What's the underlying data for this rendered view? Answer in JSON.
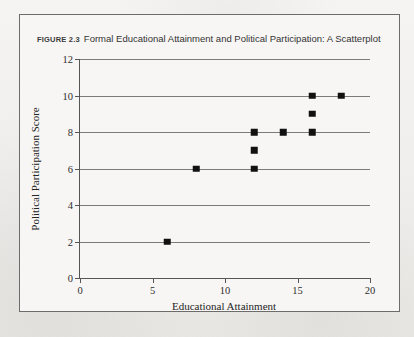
{
  "figure": {
    "label": "FIGURE 2.3",
    "caption": "Formal Educational Attainment and Political Participation: A Scatterplot"
  },
  "chart_data": {
    "type": "scatter",
    "title": "Formal Educational Attainment and Political Participation: A Scatterplot",
    "xlabel": "Educational Attainment",
    "ylabel": "Political Participation Score",
    "xlim": [
      0,
      20
    ],
    "ylim": [
      0,
      12
    ],
    "xticks": [
      0,
      5,
      10,
      15,
      20
    ],
    "yticks": [
      0,
      2,
      4,
      6,
      8,
      10,
      12
    ],
    "grid": "horizontal",
    "legend": "none",
    "marker": "square",
    "marker_color": "#111111",
    "points": [
      {
        "x": 6,
        "y": 2
      },
      {
        "x": 8,
        "y": 6
      },
      {
        "x": 12,
        "y": 6
      },
      {
        "x": 12,
        "y": 7
      },
      {
        "x": 12,
        "y": 8
      },
      {
        "x": 14,
        "y": 8
      },
      {
        "x": 16,
        "y": 8
      },
      {
        "x": 16,
        "y": 9
      },
      {
        "x": 16,
        "y": 10
      },
      {
        "x": 18,
        "y": 10
      }
    ]
  }
}
